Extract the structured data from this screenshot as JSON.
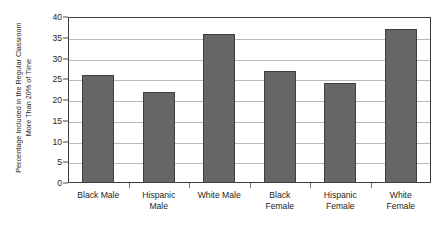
{
  "chart_data": {
    "type": "bar",
    "title": "",
    "xlabel": "",
    "ylabel": "Percentage Included in the Regular Classroom More Than 20% of Time",
    "ylabel_lines": [
      "Percentage Included in the Regular Classroom",
      "More Than 20% of Time"
    ],
    "categories": [
      "Black Male",
      "Hispanic Male",
      "White Male",
      "Black Female",
      "Hispanic Female",
      "White Female"
    ],
    "category_lines": [
      [
        "Black Male"
      ],
      [
        "Hispanic",
        "Male"
      ],
      [
        "White Male"
      ],
      [
        "Black",
        "Female"
      ],
      [
        "Hispanic",
        "Female"
      ],
      [
        "White",
        "Female"
      ]
    ],
    "values": [
      26,
      22,
      36,
      27,
      24,
      37
    ],
    "ylim": [
      0,
      40
    ],
    "ytick_step": 5,
    "yticks": [
      40,
      35,
      30,
      25,
      20,
      15,
      10,
      5,
      0
    ],
    "ytick_labels": [
      "40",
      "35",
      "30",
      "25",
      "20",
      "15",
      "10",
      "5",
      "0"
    ],
    "grid": "horizontal",
    "legend": "none",
    "bar_color": "#666666",
    "bar_edge_color": "#3f3f3f",
    "gridline_color": "#b9b9b9",
    "axis_color": "#3b3b3b",
    "background_color": "#ffffff"
  }
}
